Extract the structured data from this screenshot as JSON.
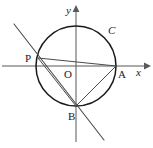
{
  "figure": {
    "background_color": "#ffffff",
    "width": 153,
    "height": 148
  },
  "axes": {
    "x_label": "x",
    "y_label": "x_placeholder",
    "y_axis_label": "y",
    "origin_label": "O",
    "axis_color": "#595959",
    "x_axis_y": 66,
    "y_axis_x": 76
  },
  "circle": {
    "label": "C",
    "center_x": 76,
    "center_y": 66,
    "radius": 40,
    "stroke_color": "#1a1a1a"
  },
  "points": [
    {
      "name": "P",
      "label": "P",
      "x": 38,
      "y": 58,
      "label_x": 25,
      "label_y": 62
    },
    {
      "name": "A",
      "label": "A",
      "x": 116,
      "y": 66,
      "label_x": 118,
      "label_y": 78
    },
    {
      "name": "B",
      "label": "B",
      "x": 76,
      "y": 106,
      "label_x": 68,
      "label_y": 120
    },
    {
      "name": "O",
      "label": "O",
      "x": 76,
      "y": 66,
      "label_x": 64,
      "label_y": 78
    }
  ],
  "segments": [
    {
      "name": "chord-PA",
      "from": "P",
      "to": "A"
    },
    {
      "name": "chord-PB",
      "from": "P",
      "to": "B"
    },
    {
      "name": "chord-AB",
      "from": "A",
      "to": "B"
    }
  ],
  "secant": {
    "name": "secant-through-P-and-B",
    "start_x": 14,
    "start_y": 24,
    "end_x": 104,
    "end_y": 140,
    "color": "#4a4a4a"
  }
}
